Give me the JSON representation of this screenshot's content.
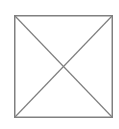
{
  "image_placeholder": {
    "icon": "broken-image-x-box",
    "stroke_color": "#808080",
    "background": "#ffffff"
  }
}
